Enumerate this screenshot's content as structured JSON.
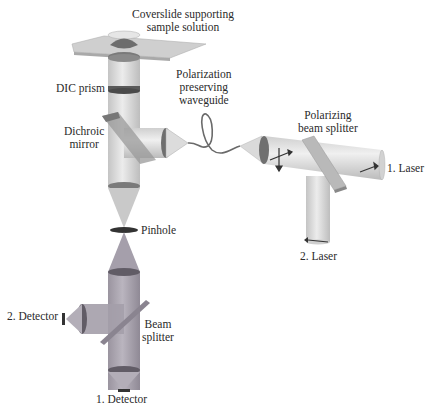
{
  "diagram": {
    "type": "optical-setup",
    "labels": {
      "coverslide": [
        "Coverslide supporting",
        "sample solution"
      ],
      "dic_prism": "DIC prism",
      "waveguide": [
        "Polarization",
        "preserving",
        "waveguide"
      ],
      "dichroic": [
        "Dichroic",
        "mirror"
      ],
      "pbs": [
        "Polarizing",
        "beam splitter"
      ],
      "laser1": "1. Laser",
      "laser2": "2. Laser",
      "pinhole": "Pinhole",
      "detector2": "2. Detector",
      "beam_splitter": [
        "Beam",
        "splitter"
      ],
      "detector1": "1. Detector"
    },
    "colors": {
      "beam_upper": "#d6d6d6",
      "beam_lower": "#a8a3ad",
      "element_dark": "#4a4a4a",
      "plate": "#c8c8c8"
    }
  }
}
